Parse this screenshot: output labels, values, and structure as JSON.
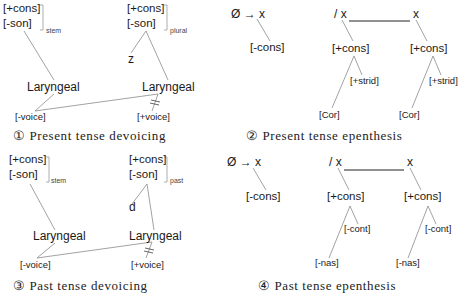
{
  "figure": {
    "panels": [
      {
        "id": 1,
        "caption": "① Present tense devoicing",
        "left_matrix": {
          "line1": "[+cons]",
          "line2": "[-son]",
          "subscript": "stem"
        },
        "right_matrix": {
          "line1": "[+cons]",
          "line2": "[-son]",
          "subscript": "plural"
        },
        "segment": "z",
        "left_node": "Laryngeal",
        "right_node": "Laryngeal",
        "left_feature": "[-voice]",
        "right_feature": "[+voice]"
      },
      {
        "id": 2,
        "caption": "② Present tense epenthesis",
        "rule": {
          "lhs": "Ø → x",
          "env_slash": "/ x",
          "env_right": "x"
        },
        "inserted_feature": "[-cons]",
        "left_tree": {
          "root": "[+cons]",
          "dependent_right": "[+strid]",
          "dependent_left": "[Cor]"
        },
        "right_tree": {
          "root": "[+cons]",
          "dependent_right": "[+strid]",
          "dependent_left": "[Cor]"
        }
      },
      {
        "id": 3,
        "caption": "③ Past tense devoicing",
        "left_matrix": {
          "line1": "[+cons]",
          "line2": "[-son]",
          "subscript": "stem"
        },
        "right_matrix": {
          "line1": "[+cons]",
          "line2": "[-son]",
          "subscript": "past"
        },
        "segment": "d",
        "left_node": "Laryngeal",
        "right_node": "Laryngeal",
        "left_feature": "[-voice]",
        "right_feature": "[+voice]"
      },
      {
        "id": 4,
        "caption": "④ Past tense epenthesis",
        "rule": {
          "lhs": "Ø → x",
          "env_slash": "/ x",
          "env_right": "x"
        },
        "inserted_feature": "[-cons]",
        "left_tree": {
          "root": "[+cons]",
          "dependent_right": "[-cont]",
          "dependent_left": "[-nas]"
        },
        "right_tree": {
          "root": "[+cons]",
          "dependent_right": "[-cont]",
          "dependent_left": "[-nas]"
        }
      }
    ]
  },
  "colors": {
    "background": "#ffffff",
    "text": "#1a1a1a",
    "association_line": "#8a8a8a"
  }
}
